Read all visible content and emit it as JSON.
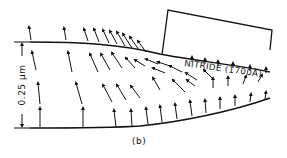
{
  "figure": {
    "panel_label": "(b)",
    "nitride_label": "NITRIDE (1700Å)",
    "scale_label": "0.25 μm",
    "colors": {
      "ink": "#111111",
      "background": "#ffffff"
    }
  },
  "regions": [
    {
      "name": "nitride-mask",
      "description": "Nitride layer over right portion of oxide"
    },
    {
      "name": "oxide-layer",
      "description": "Oxide with displacement/flow vector field"
    }
  ]
}
